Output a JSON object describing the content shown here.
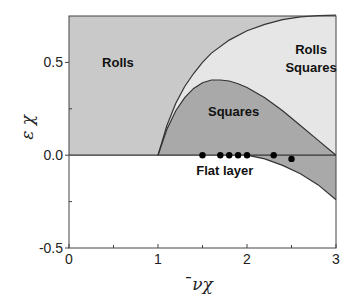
{
  "chart_data": {
    "type": "area",
    "title": "",
    "xlabel": "̄νχ",
    "ylabel": "ε χ",
    "xlim": [
      0,
      3
    ],
    "ylim": [
      -0.5,
      0.75
    ],
    "x_ticks": [
      {
        "value": 0,
        "label": "0"
      },
      {
        "value": 1,
        "label": "1"
      },
      {
        "value": 2,
        "label": "2"
      },
      {
        "value": 3,
        "label": "3"
      }
    ],
    "x_minor_ticks": [
      0.5,
      1.5,
      2.5
    ],
    "y_ticks": [
      {
        "value": -0.5,
        "label": "-0.5"
      },
      {
        "value": 0.0,
        "label": "0.0"
      },
      {
        "value": 0.5,
        "label": "0.5"
      }
    ],
    "y_minor_ticks": [
      -0.25,
      0.25
    ],
    "grid": false,
    "colors": {
      "rolls": "#c9c9c9",
      "rolls_squares": "#e6e6e6",
      "squares": "#a9a9a9",
      "flat_layer": "#ffffff",
      "lines": "#333333",
      "points": "#000000"
    },
    "regions": [
      {
        "name": "Rolls",
        "label": "Rolls",
        "label_pos": [
          0.55,
          0.5
        ]
      },
      {
        "name": "Rolls Squares",
        "label": [
          "Rolls",
          "Squares"
        ],
        "label_pos": [
          2.72,
          0.5
        ]
      },
      {
        "name": "Squares",
        "label": "Squares",
        "label_pos": [
          1.85,
          0.24
        ]
      },
      {
        "name": "Flat layer",
        "label": "Flat layer",
        "label_pos": [
          1.75,
          -0.08
        ]
      }
    ],
    "curves": {
      "rolls_boundary": {
        "x": [
          1.0,
          1.1,
          1.2,
          1.3,
          1.4,
          1.5,
          1.6,
          1.8,
          2.0,
          2.2,
          2.4,
          2.6,
          2.8,
          3.0
        ],
        "y": [
          0.0,
          0.16,
          0.28,
          0.37,
          0.44,
          0.5,
          0.55,
          0.62,
          0.67,
          0.705,
          0.73,
          0.745,
          0.752,
          0.755
        ]
      },
      "squares_boundary": {
        "x": [
          1.0,
          1.1,
          1.2,
          1.3,
          1.4,
          1.5,
          1.6,
          1.7,
          1.8,
          1.9,
          2.0,
          2.2,
          2.4,
          2.6,
          2.8,
          3.0
        ],
        "y": [
          0.0,
          0.14,
          0.24,
          0.31,
          0.36,
          0.39,
          0.405,
          0.405,
          0.4,
          0.385,
          0.365,
          0.31,
          0.24,
          0.16,
          0.08,
          0.0
        ]
      },
      "flat_boundary": {
        "x": [
          2.0,
          2.2,
          2.4,
          2.6,
          2.8,
          3.0
        ],
        "y": [
          0.0,
          -0.02,
          -0.055,
          -0.1,
          -0.16,
          -0.24
        ]
      }
    },
    "points": {
      "x": [
        1.5,
        1.7,
        1.8,
        1.9,
        2.0,
        2.3,
        2.5
      ],
      "y": [
        0.0,
        0.0,
        0.0,
        0.0,
        0.0,
        0.0,
        -0.02
      ]
    }
  }
}
